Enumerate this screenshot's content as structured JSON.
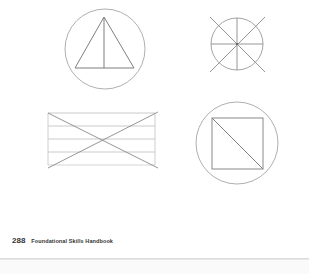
{
  "figures": [
    {
      "name": "circle-with-triangle",
      "description": "Circle enclosing a triangle split by a vertical line"
    },
    {
      "name": "circle-with-eight-spokes",
      "description": "Circle divided by vertical, horizontal and two extended diagonal lines"
    },
    {
      "name": "rectangle-with-lines-and-x",
      "description": "Rectangle with horizontal lines crossed by two diagonals"
    },
    {
      "name": "circle-with-square",
      "description": "Circle enclosing a square split by a diagonal"
    }
  ],
  "colors": {
    "stroke": "#8c8c8c",
    "light_stroke": "#bdbdbd",
    "text": "#333333"
  },
  "footer": {
    "page_number": "288",
    "book_title": "Foundational Skills Handbook"
  }
}
